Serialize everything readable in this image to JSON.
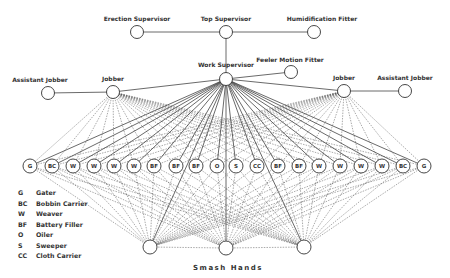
{
  "diagram": {
    "top_nodes": [
      {
        "id": "erection",
        "label": "Erection Supervisor",
        "x": 137,
        "y": 32,
        "lx": 137,
        "ly": 21
      },
      {
        "id": "top",
        "label": "Top Supervisor",
        "x": 226,
        "y": 32,
        "lx": 226,
        "ly": 21
      },
      {
        "id": "humid",
        "label": "Humidification Fitter",
        "x": 314,
        "y": 32,
        "lx": 322,
        "ly": 21
      }
    ],
    "work_supervisor": {
      "label": "Work Supervisor",
      "x": 226,
      "y": 79,
      "lx": 226,
      "ly": 67
    },
    "feeler": {
      "label": "Feeler Motion Fitter",
      "x": 291,
      "y": 72,
      "lx": 290,
      "ly": 62
    },
    "jobbers": [
      {
        "label": "Jobber",
        "x": 113,
        "y": 92,
        "lx": 113,
        "ly": 81
      },
      {
        "label": "Jobber",
        "x": 344,
        "y": 91,
        "lx": 344,
        "ly": 80
      }
    ],
    "assistants": [
      {
        "label": "Assistant Jobber",
        "x": 48,
        "y": 93,
        "lx": 40,
        "ly": 82
      },
      {
        "label": "Assistant Jobber",
        "x": 405,
        "y": 91,
        "lx": 405,
        "ly": 80
      }
    ],
    "workers": [
      {
        "code": "G",
        "x": 30
      },
      {
        "code": "BC",
        "x": 52
      },
      {
        "code": "W",
        "x": 73
      },
      {
        "code": "W",
        "x": 94
      },
      {
        "code": "W",
        "x": 114
      },
      {
        "code": "W",
        "x": 134
      },
      {
        "code": "BF",
        "x": 154
      },
      {
        "code": "BF",
        "x": 176
      },
      {
        "code": "BF",
        "x": 196
      },
      {
        "code": "O",
        "x": 217
      },
      {
        "code": "S",
        "x": 236
      },
      {
        "code": "CC",
        "x": 257
      },
      {
        "code": "BF",
        "x": 278
      },
      {
        "code": "BF",
        "x": 299
      },
      {
        "code": "W",
        "x": 319
      },
      {
        "code": "W",
        "x": 340
      },
      {
        "code": "W",
        "x": 361
      },
      {
        "code": "W",
        "x": 382
      },
      {
        "code": "BC",
        "x": 403
      },
      {
        "code": "G",
        "x": 424
      }
    ],
    "worker_row_y": 166,
    "smash_nodes": [
      {
        "x": 150,
        "y": 247
      },
      {
        "x": 226,
        "y": 248
      },
      {
        "x": 304,
        "y": 247
      }
    ],
    "smash_caption": "Smash Hands",
    "legend": [
      {
        "code": "G",
        "label": "Gater"
      },
      {
        "code": "BC",
        "label": "Bobbin Carrier"
      },
      {
        "code": "W",
        "label": "Weaver"
      },
      {
        "code": "BF",
        "label": "Battery Filler"
      },
      {
        "code": "O",
        "label": "Oiler"
      },
      {
        "code": "S",
        "label": "Sweeper"
      },
      {
        "code": "CC",
        "label": "Cloth Carrier"
      }
    ]
  }
}
